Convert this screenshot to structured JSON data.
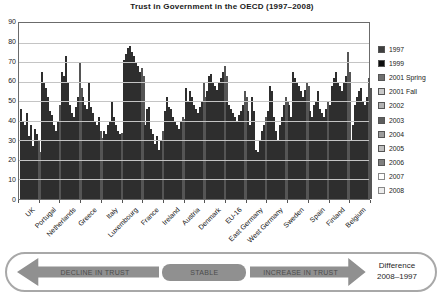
{
  "title": "Trust in Government in the OECD (1997–2008)",
  "chart_data": {
    "type": "bar",
    "title": "Trust in Government in the OECD (1997–2008)",
    "xlabel": "",
    "ylabel": "",
    "ylim": [
      0,
      90
    ],
    "yticks": [
      0,
      10,
      20,
      30,
      40,
      50,
      60,
      70,
      80,
      90
    ],
    "grid": true,
    "legend_position": "right",
    "categories": [
      "UK",
      "Portugal",
      "Netherlands",
      "Greece",
      "Italy",
      "Luxembourg",
      "France",
      "Ireland",
      "Austria",
      "Denmark",
      "EU-16",
      "East Germany",
      "West Germany",
      "Sweden",
      "Spain",
      "Finland",
      "Belgium"
    ],
    "series": [
      {
        "name": "1997",
        "color": "#3f3f3f",
        "values": [
          46,
          65,
          65,
          52,
          35,
          71,
          38,
          45,
          57,
          55,
          50,
          45,
          45,
          48,
          45,
          48,
          30
        ]
      },
      {
        "name": "1999",
        "color": "#0d0d0d",
        "values": [
          40,
          60,
          63,
          48,
          33,
          74,
          46,
          52,
          50,
          63,
          48,
          38,
          58,
          42,
          42,
          58,
          38
        ]
      },
      {
        "name": "2001 Spring",
        "color": "#6f6f6f",
        "values": [
          38,
          57,
          73,
          46,
          38,
          77,
          47,
          47,
          55,
          64,
          46,
          52,
          55,
          65,
          48,
          62,
          48
        ]
      },
      {
        "name": "2001 Fall",
        "color": "#c9c9c9",
        "values": [
          44,
          52,
          60,
          60,
          40,
          78,
          36,
          46,
          52,
          60,
          44,
          45,
          42,
          62,
          50,
          65,
          52
        ]
      },
      {
        "name": "2002",
        "color": "#b2b2b2",
        "values": [
          32,
          45,
          48,
          47,
          50,
          75,
          33,
          42,
          48,
          58,
          42,
          25,
          35,
          60,
          55,
          60,
          55
        ]
      },
      {
        "name": "2003",
        "color": "#5d5d5d",
        "values": [
          38,
          43,
          44,
          44,
          42,
          73,
          28,
          40,
          46,
          56,
          40,
          24,
          30,
          58,
          46,
          58,
          57
        ]
      },
      {
        "name": "2004",
        "color": "#9c9c9c",
        "values": [
          27,
          38,
          42,
          40,
          38,
          70,
          32,
          38,
          44,
          60,
          43,
          30,
          38,
          55,
          44,
          55,
          50
        ]
      },
      {
        "name": "2005",
        "color": "#bfbfbf",
        "values": [
          36,
          35,
          47,
          38,
          35,
          68,
          25,
          36,
          47,
          62,
          45,
          35,
          42,
          52,
          42,
          60,
          48
        ]
      },
      {
        "name": "2006",
        "color": "#7f7f7f",
        "values": [
          33,
          40,
          52,
          42,
          33,
          65,
          30,
          40,
          50,
          65,
          48,
          38,
          48,
          56,
          46,
          63,
          52
        ]
      },
      {
        "name": "2007",
        "color": "#ffffff",
        "values": [
          30,
          48,
          70,
          35,
          34,
          67,
          35,
          42,
          60,
          68,
          55,
          42,
          52,
          60,
          50,
          75,
          62
        ]
      },
      {
        "name": "2008",
        "color": "#ededed",
        "values": [
          24,
          44,
          57,
          31,
          31,
          63,
          33,
          41,
          52,
          63,
          52,
          40,
          50,
          58,
          48,
          65,
          57
        ]
      }
    ]
  },
  "banner": {
    "decline_label": "DECLINE IN TRUST",
    "stable_label": "STABLE",
    "increase_label": "INCREASE IN TRUST",
    "difference_line1": "Difference",
    "difference_line2": "2008–1997",
    "arrow_color": "#909090"
  }
}
